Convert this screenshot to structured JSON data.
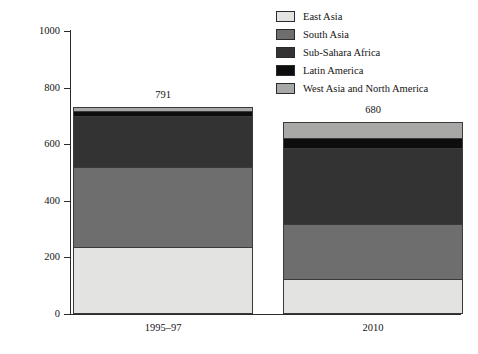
{
  "chart_data": {
    "type": "bar",
    "subtype": "stacked-vertical",
    "title": "",
    "xlabel": "",
    "ylabel": "Millions",
    "ylim": [
      0,
      1000
    ],
    "yticks": [
      0,
      200,
      400,
      600,
      800,
      1000
    ],
    "ytick_labels": [
      "0",
      "200",
      "400",
      "600",
      "800",
      "1000"
    ],
    "grid": false,
    "legend_position": "top-right",
    "categories": [
      "1995–97",
      "2010"
    ],
    "totals": [
      791,
      680
    ],
    "total_labels": [
      "791",
      "680"
    ],
    "series": [
      {
        "name": "East Asia",
        "color": "#e3e3e1",
        "values": [
          236,
          120
        ]
      },
      {
        "name": "South Asia",
        "color": "#6e6e6e",
        "values": [
          286,
          198
        ]
      },
      {
        "name": "Sub-Sahara Africa",
        "color": "#333333",
        "values": [
          180,
          270
        ]
      },
      {
        "name": "Latin America",
        "color": "#0d0d0d",
        "values": [
          19,
          38
        ]
      },
      {
        "name": "West Asia and North America",
        "color": "#a8a8a6",
        "values": [
          10,
          54
        ]
      }
    ]
  },
  "legend": {
    "items": [
      {
        "label": "East Asia"
      },
      {
        "label": "South Asia"
      },
      {
        "label": "Sub-Sahara Africa"
      },
      {
        "label": "Latin America"
      },
      {
        "label": "West Asia and North America"
      }
    ]
  }
}
